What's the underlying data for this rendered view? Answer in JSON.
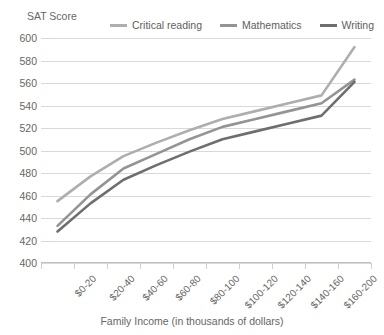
{
  "chart_data": {
    "type": "line",
    "title": "",
    "ylabel": "SAT Score",
    "xlabel": "Family Income (in thousands of dollars)",
    "ylim": [
      400,
      600
    ],
    "ytick_step": 20,
    "yticks": [
      600,
      580,
      560,
      540,
      520,
      500,
      480,
      460,
      440,
      420,
      400
    ],
    "grid": true,
    "legend_position": "top",
    "categories": [
      "$0-20",
      "$20-40",
      "$40-60",
      "$60-80",
      "$80-100",
      "$100-120",
      "$120-140",
      "$140-160",
      "$160-200",
      ""
    ],
    "series": [
      {
        "name": "Critical reading",
        "color": "#aeaeae",
        "values": [
          455,
          477,
          495,
          507,
          518,
          528,
          535,
          542,
          549,
          592
        ]
      },
      {
        "name": "Mathematics",
        "color": "#949494",
        "values": [
          433,
          461,
          484,
          497,
          510,
          521,
          528,
          535,
          542,
          563
        ]
      },
      {
        "name": "Writing",
        "color": "#6e6e6e",
        "values": [
          428,
          453,
          474,
          487,
          499,
          510,
          517,
          524,
          531,
          561
        ]
      }
    ]
  },
  "legend": {
    "items": [
      {
        "label": "Critical reading",
        "color": "#aeaeae"
      },
      {
        "label": "Mathematics",
        "color": "#949494"
      },
      {
        "label": "Writing",
        "color": "#6e6e6e"
      }
    ]
  }
}
